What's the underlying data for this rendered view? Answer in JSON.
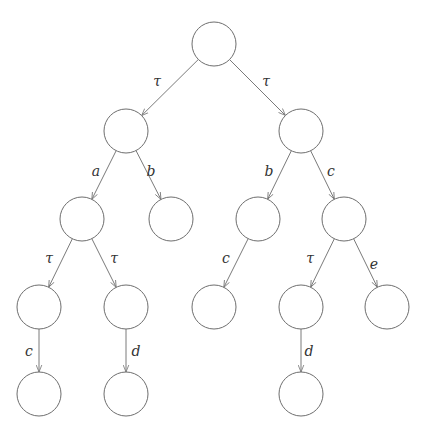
{
  "diagram": {
    "type": "transition-tree",
    "nodes": [
      {
        "id": "n0"
      },
      {
        "id": "n1"
      },
      {
        "id": "n2"
      },
      {
        "id": "n3"
      },
      {
        "id": "n4"
      },
      {
        "id": "n5"
      },
      {
        "id": "n6"
      },
      {
        "id": "n7"
      },
      {
        "id": "n8"
      },
      {
        "id": "n9"
      },
      {
        "id": "n10"
      },
      {
        "id": "n11"
      },
      {
        "id": "n12"
      },
      {
        "id": "n13"
      },
      {
        "id": "n14"
      }
    ],
    "edges": [
      {
        "from": "n0",
        "to": "n1",
        "label": "τ"
      },
      {
        "from": "n0",
        "to": "n2",
        "label": "τ"
      },
      {
        "from": "n1",
        "to": "n3",
        "label": "a"
      },
      {
        "from": "n1",
        "to": "n4",
        "label": "b"
      },
      {
        "from": "n2",
        "to": "n5",
        "label": "b"
      },
      {
        "from": "n2",
        "to": "n6",
        "label": "c"
      },
      {
        "from": "n3",
        "to": "n7",
        "label": "τ"
      },
      {
        "from": "n3",
        "to": "n8",
        "label": "τ"
      },
      {
        "from": "n5",
        "to": "n9",
        "label": "c"
      },
      {
        "from": "n6",
        "to": "n10",
        "label": "τ"
      },
      {
        "from": "n6",
        "to": "n11",
        "label": "e"
      },
      {
        "from": "n7",
        "to": "n12",
        "label": "c"
      },
      {
        "from": "n8",
        "to": "n13",
        "label": "d"
      },
      {
        "from": "n10",
        "to": "n14",
        "label": "d"
      }
    ]
  }
}
